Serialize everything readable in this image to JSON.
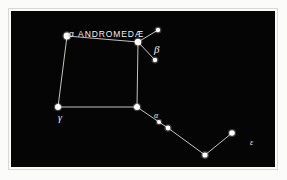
{
  "figure": {
    "kind": "star-chart",
    "plate_background": "#fbfbfa",
    "sky_background": "#050505",
    "star_color": "#ffffff",
    "line_color": "#d9d9d4",
    "label_color": "#f2f2ee"
  },
  "chart_data": {
    "type": "scatter",
    "title": "",
    "xlabel": "",
    "ylabel": "",
    "xlim": [
      0,
      264
    ],
    "ylim": [
      0,
      156
    ],
    "grid": false,
    "legend": "none",
    "coordinate_note": "pixel coordinates within the black sky panel, origin top-left",
    "stars": [
      {
        "id": "alpheratz",
        "label": "α ANDROMEDÆ",
        "label_id": "alpha-andromedae",
        "x": 56,
        "y": 25,
        "r": 3.4,
        "magnitude_rank": 1
      },
      {
        "id": "beta",
        "label": "β",
        "label_id": "beta",
        "x": 127,
        "y": 31,
        "r": 3.2,
        "magnitude_rank": 1
      },
      {
        "id": "gamma",
        "label": "γ",
        "label_id": "gamma",
        "x": 47,
        "y": 96,
        "r": 3.0,
        "magnitude_rank": 1
      },
      {
        "id": "alpha",
        "label": "α",
        "label_id": "alpha",
        "x": 126,
        "y": 96,
        "r": 3.0,
        "magnitude_rank": 1
      },
      {
        "id": "epsilon",
        "label": "ε",
        "label_id": "epsilon",
        "x": 221,
        "y": 122,
        "r": 2.8,
        "magnitude_rank": 2
      },
      {
        "id": "branch-ne",
        "label": "",
        "label_id": "",
        "x": 147,
        "y": 19,
        "r": 2.2,
        "magnitude_rank": 3
      },
      {
        "id": "branch-se",
        "label": "",
        "label_id": "",
        "x": 144,
        "y": 49,
        "r": 2.2,
        "magnitude_rank": 3
      },
      {
        "id": "chain-1",
        "label": "",
        "label_id": "",
        "x": 148,
        "y": 111,
        "r": 2.0,
        "magnitude_rank": 3
      },
      {
        "id": "chain-2",
        "label": "",
        "label_id": "",
        "x": 157,
        "y": 117,
        "r": 2.4,
        "magnitude_rank": 3
      },
      {
        "id": "chain-3",
        "label": "",
        "label_id": "",
        "x": 194,
        "y": 144,
        "r": 2.6,
        "magnitude_rank": 2
      }
    ],
    "lines": [
      {
        "from": "alpheratz",
        "to": "beta"
      },
      {
        "from": "alpheratz",
        "to": "gamma"
      },
      {
        "from": "gamma",
        "to": "alpha"
      },
      {
        "from": "alpha",
        "to": "beta"
      },
      {
        "from": "beta",
        "to": "branch-ne"
      },
      {
        "from": "beta",
        "to": "branch-se"
      },
      {
        "from": "alpha",
        "to": "chain-1"
      },
      {
        "from": "chain-1",
        "to": "chain-2"
      },
      {
        "from": "chain-2",
        "to": "chain-3"
      },
      {
        "from": "chain-3",
        "to": "epsilon"
      }
    ]
  },
  "labels": {
    "alpha_andromedae": "α ANDROMEDÆ",
    "beta": "β",
    "gamma": "γ",
    "alpha": "α",
    "epsilon": "ε"
  }
}
